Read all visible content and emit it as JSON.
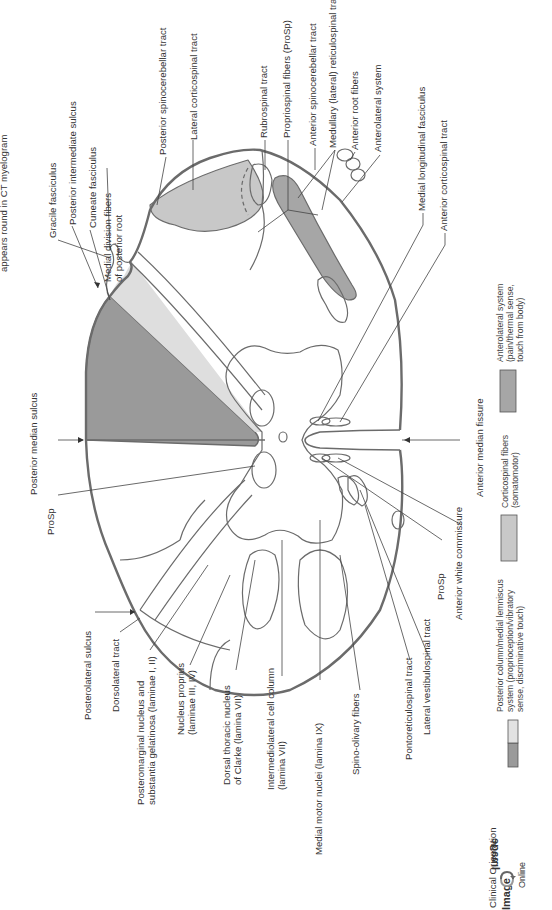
{
  "caption_fragment": "appears round in CT myelogram",
  "colors": {
    "outline": "#6b6b6b",
    "posterior_column_dark": "#9a9a9a",
    "posterior_column_light": "#dedede",
    "corticospinal": "#c8c8c8",
    "anterolateral": "#a6a6a6",
    "leader_line": "#444444",
    "background": "#ffffff"
  },
  "labels": {
    "top": {
      "gracile_fasciculus": "Gracile fasciculus",
      "posterior_intermediate_sulcus": "Posterior intermediate sulcus",
      "cuneate_fasciculus": "Cuneate fasciculus",
      "medial_division_fibers_1": "Medial division fibers",
      "medial_division_fibers_2": "of posterior root",
      "posterior_spinocerebellar_tract": "Posterior spinocerebellar tract",
      "lateral_corticospinal_tract": "Lateral corticospinal tract",
      "rubrospinal_tract": "Rubrospinal tract",
      "propriospinal_fibers": "Propriospinal fibers (ProSp)",
      "anterior_spinocerebellar_tract": "Anterior spinocerebellar tract",
      "medullary_reticulospinal_tract": "Medullary (lateral) reticulospinal tract",
      "anterior_root_fibers": "Anterior root fibers",
      "anterolateral_system": "Anterolateral system",
      "medial_longitudinal_fasciculus": "Medial longitudinal fasciculus",
      "anterior_corticospinal_tract": "Anterior corticospinal tract"
    },
    "left": {
      "posterior_median_sulcus": "Posterior median sulcus",
      "prosp_left": "ProSp"
    },
    "right": {
      "anterior_median_fissure": "Anterior median fissure"
    },
    "bottom": {
      "posterolateral_sulcus": "Posterolateral sulcus",
      "dorsolateral_tract": "Dorsolateral tract",
      "posteromarginal_1": "Posteromarginal nucleus and",
      "posteromarginal_2": "substantia gelatinosa (laminae I, II)",
      "nucleus_proprius_1": "Nucleus proprius",
      "nucleus_proprius_2": "(laminae III, IV)",
      "dorsal_thoracic_1": "Dorsal thoracic nucleus",
      "dorsal_thoracic_2": "of Clarke (lamina VII)",
      "intermediolateral_1": "Intermediolateral cell column",
      "intermediolateral_2": "(lamina VII)",
      "medial_motor_nuclei": "Medial motor nuclei (lamina IX)",
      "spino_olivary_fibers": "Spino-olivary fibers",
      "pontoreticulospinal_tract": "Pontoreticulospinal tract",
      "lateral_vestibulospinal_tract": "Lateral vestibulospinal tract",
      "prosp_right": "ProSp",
      "anterior_white_commissure": "Anterior white commissure"
    }
  },
  "legend": [
    {
      "id": "posterior_column",
      "line1": "Posterior column/medial lemniscus",
      "line2": "system (proprioception/vibratory",
      "line3": "sense, discriminative touch)"
    },
    {
      "id": "corticospinal",
      "line1": "Corticospinal fibers",
      "line2": "(somatomotor)"
    },
    {
      "id": "anterolateral",
      "line1": "Anterolateral system",
      "line2": "(pain/thermal sense,",
      "line3": "touch from body)"
    }
  ],
  "logo": {
    "line1": "Clinical Orientation",
    "image_word": "Image",
    "image_word_mirrored": "Image",
    "online": "Online",
    "icon": "rotate-arrows-icon"
  }
}
